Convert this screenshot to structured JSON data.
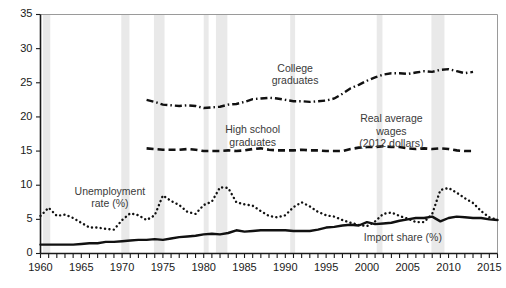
{
  "chart_data": {
    "type": "line",
    "title": "",
    "subtitle": "",
    "xlabel": "",
    "ylabel": "",
    "xlim": [
      1960,
      2016
    ],
    "ylim": [
      0,
      35
    ],
    "yticks": [
      0,
      5,
      10,
      15,
      20,
      25,
      30,
      35
    ],
    "ytick_labels": [
      "0",
      "5",
      "10",
      "15",
      "20",
      "25",
      "30",
      "35"
    ],
    "xticks": [
      1960,
      1965,
      1970,
      1975,
      1980,
      1985,
      1990,
      1995,
      2000,
      2005,
      2010,
      2015
    ],
    "xtick_labels": [
      "1960",
      "1965",
      "1970",
      "1975",
      "1980",
      "1985",
      "1990",
      "1995",
      "2000",
      "2005",
      "2010",
      "2015"
    ],
    "xtick_minor_step": 1,
    "grid": false,
    "legend_position": "inline-annotations",
    "line_color": "#111111",
    "recession_band_color": "#e9e9e9",
    "annotations": [
      {
        "name": "college-graduates",
        "text": "College\ngraduates",
        "x": 1991.2,
        "y": 26.6
      },
      {
        "name": "high-school-graduates",
        "text": "High school\ngraduates",
        "x": 1986.0,
        "y": 17.6
      },
      {
        "name": "real-average-wages",
        "text": "Real average\nwages\n(2012 dollars)",
        "x": 2003.0,
        "y": 19.2
      },
      {
        "name": "unemployment-rate",
        "text": "Unemployment\nrate (%)",
        "x": 1968.5,
        "y": 8.6
      },
      {
        "name": "import-share",
        "text": "Import share (%)",
        "x": 2004.4,
        "y": 1.9
      }
    ],
    "recessions": [
      {
        "start": 1960.3,
        "end": 1961.2
      },
      {
        "start": 1969.9,
        "end": 1970.9
      },
      {
        "start": 1973.9,
        "end": 1975.2
      },
      {
        "start": 1980.0,
        "end": 1980.6
      },
      {
        "start": 1981.5,
        "end": 1982.9
      },
      {
        "start": 1990.6,
        "end": 1991.2
      },
      {
        "start": 2001.2,
        "end": 2001.9
      },
      {
        "start": 2007.9,
        "end": 2009.5
      }
    ],
    "series": [
      {
        "name": "Unemployment rate (%)",
        "style": "dotted",
        "units": "percent",
        "x": [
          1960,
          1961,
          1962,
          1963,
          1964,
          1965,
          1966,
          1967,
          1968,
          1969,
          1970,
          1971,
          1972,
          1973,
          1974,
          1975,
          1976,
          1977,
          1978,
          1979,
          1980,
          1981,
          1982,
          1983,
          1984,
          1985,
          1986,
          1987,
          1988,
          1989,
          1990,
          1991,
          1992,
          1993,
          1994,
          1995,
          1996,
          1997,
          1998,
          1999,
          2000,
          2001,
          2002,
          2003,
          2004,
          2005,
          2006,
          2007,
          2008,
          2009,
          2010,
          2011,
          2012,
          2013,
          2014,
          2015,
          2016
        ],
        "values": [
          5.5,
          6.7,
          5.5,
          5.7,
          5.2,
          4.5,
          3.8,
          3.8,
          3.6,
          3.5,
          4.9,
          5.9,
          5.6,
          4.9,
          5.6,
          8.5,
          7.7,
          7.1,
          6.1,
          5.8,
          7.1,
          7.6,
          9.7,
          9.6,
          7.5,
          7.2,
          7.0,
          6.2,
          5.5,
          5.3,
          5.6,
          6.8,
          7.5,
          6.9,
          6.1,
          5.6,
          5.4,
          4.9,
          4.5,
          4.2,
          4.0,
          4.7,
          5.8,
          6.0,
          5.5,
          5.1,
          4.6,
          4.6,
          5.8,
          9.3,
          9.6,
          8.9,
          8.1,
          7.4,
          6.2,
          5.3,
          4.9
        ]
      },
      {
        "name": "Import share (%)",
        "style": "solid",
        "units": "percent",
        "x": [
          1960,
          1961,
          1962,
          1963,
          1964,
          1965,
          1966,
          1967,
          1968,
          1969,
          1970,
          1971,
          1972,
          1973,
          1974,
          1975,
          1976,
          1977,
          1978,
          1979,
          1980,
          1981,
          1982,
          1983,
          1984,
          1985,
          1986,
          1987,
          1988,
          1989,
          1990,
          1991,
          1992,
          1993,
          1994,
          1995,
          1996,
          1997,
          1998,
          1999,
          2000,
          2001,
          2002,
          2003,
          2004,
          2005,
          2006,
          2007,
          2008,
          2009,
          2010,
          2011,
          2012,
          2013,
          2014,
          2015,
          2016
        ],
        "values": [
          1.3,
          1.3,
          1.3,
          1.3,
          1.3,
          1.4,
          1.5,
          1.5,
          1.7,
          1.7,
          1.8,
          1.9,
          2.0,
          2.0,
          2.1,
          2.0,
          2.2,
          2.4,
          2.5,
          2.6,
          2.8,
          2.9,
          2.8,
          3.0,
          3.4,
          3.2,
          3.3,
          3.4,
          3.4,
          3.4,
          3.4,
          3.3,
          3.3,
          3.3,
          3.5,
          3.8,
          3.9,
          4.1,
          4.2,
          4.1,
          4.6,
          4.3,
          4.4,
          4.5,
          4.8,
          5.0,
          5.2,
          5.2,
          5.4,
          4.7,
          5.2,
          5.4,
          5.3,
          5.2,
          5.2,
          5.0,
          4.9
        ]
      },
      {
        "name": "High school graduates",
        "style": "dashed",
        "units": "dollars_per_hour_2012",
        "x": [
          1973,
          1974,
          1975,
          1976,
          1977,
          1978,
          1979,
          1980,
          1981,
          1982,
          1983,
          1984,
          1985,
          1986,
          1987,
          1988,
          1989,
          1990,
          1991,
          1992,
          1993,
          1994,
          1995,
          1996,
          1997,
          1998,
          1999,
          2000,
          2001,
          2002,
          2003,
          2004,
          2005,
          2006,
          2007,
          2008,
          2009,
          2010,
          2011,
          2012,
          2013
        ],
        "values": [
          15.4,
          15.3,
          15.2,
          15.2,
          15.2,
          15.3,
          15.2,
          15.0,
          15.0,
          15.0,
          15.1,
          15.0,
          15.1,
          15.3,
          15.4,
          15.2,
          15.1,
          15.1,
          15.1,
          15.2,
          15.1,
          15.1,
          15.0,
          15.0,
          15.0,
          15.3,
          15.5,
          15.6,
          15.6,
          15.7,
          15.6,
          15.6,
          15.4,
          15.3,
          15.4,
          15.3,
          15.4,
          15.3,
          15.1,
          15.0,
          15.0
        ]
      },
      {
        "name": "College graduates",
        "style": "dashdot",
        "units": "dollars_per_hour_2012",
        "x": [
          1973,
          1974,
          1975,
          1976,
          1977,
          1978,
          1979,
          1980,
          1981,
          1982,
          1983,
          1984,
          1985,
          1986,
          1987,
          1988,
          1989,
          1990,
          1991,
          1992,
          1993,
          1994,
          1995,
          1996,
          1997,
          1998,
          1999,
          2000,
          2001,
          2002,
          2003,
          2004,
          2005,
          2006,
          2007,
          2008,
          2009,
          2010,
          2011,
          2012,
          2013
        ],
        "values": [
          22.5,
          22.2,
          21.8,
          21.7,
          21.6,
          21.7,
          21.6,
          21.3,
          21.4,
          21.5,
          21.8,
          21.9,
          22.2,
          22.6,
          22.7,
          22.8,
          22.7,
          22.5,
          22.3,
          22.3,
          22.2,
          22.3,
          22.4,
          22.7,
          23.4,
          24.2,
          24.7,
          25.3,
          25.8,
          26.2,
          26.4,
          26.4,
          26.3,
          26.5,
          26.7,
          26.6,
          26.9,
          27.0,
          26.7,
          26.4,
          26.6
        ]
      }
    ]
  }
}
